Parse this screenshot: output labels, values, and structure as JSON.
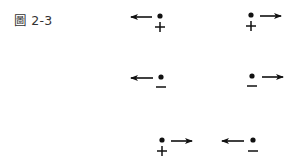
{
  "figure": {
    "caption": "圖 2-3",
    "items": [
      {
        "id": "top-left",
        "charge": "+",
        "arrow": "left"
      },
      {
        "id": "top-right",
        "charge": "+",
        "arrow": "right"
      },
      {
        "id": "mid-left",
        "charge": "-",
        "arrow": "left"
      },
      {
        "id": "mid-right",
        "charge": "-",
        "arrow": "right"
      },
      {
        "id": "bottom-left",
        "charge": "+",
        "arrow": "right"
      },
      {
        "id": "bottom-right",
        "charge": "-",
        "arrow": "left"
      }
    ],
    "colors": {
      "ink": "#111111",
      "background": "#ffffff"
    }
  }
}
